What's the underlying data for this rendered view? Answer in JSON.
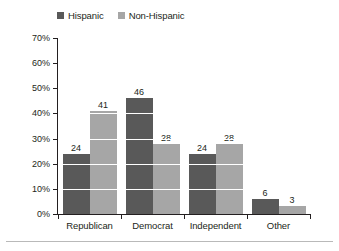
{
  "chart_data": {
    "type": "bar",
    "title": "",
    "xlabel": "",
    "ylabel": "",
    "ylim": [
      0,
      70
    ],
    "ytick_step": 10,
    "ytick_suffix": "%",
    "grid": true,
    "grid_color": "#FFFFFF",
    "legend_position": "top-left",
    "categories": [
      "Republican",
      "Democrat",
      "Independent",
      "Other"
    ],
    "ytick_labels": [
      "70%",
      "60%",
      "50%",
      "40%",
      "30%",
      "20%",
      "10%",
      "0%"
    ],
    "ytick_values": [
      70,
      60,
      50,
      40,
      30,
      20,
      10,
      0
    ],
    "series": [
      {
        "name": "Hispanic",
        "color": "#595959",
        "values": [
          24,
          46,
          24,
          6
        ],
        "labels": [
          "24",
          "46",
          "24",
          "6"
        ]
      },
      {
        "name": "Non-Hispanic",
        "color": "#A6A6A6",
        "values": [
          41,
          28,
          28,
          3
        ],
        "labels": [
          "41",
          "28",
          "28",
          "3"
        ]
      }
    ]
  },
  "axis": {
    "line_color": "#231F20"
  },
  "background": "#FFFFFF"
}
